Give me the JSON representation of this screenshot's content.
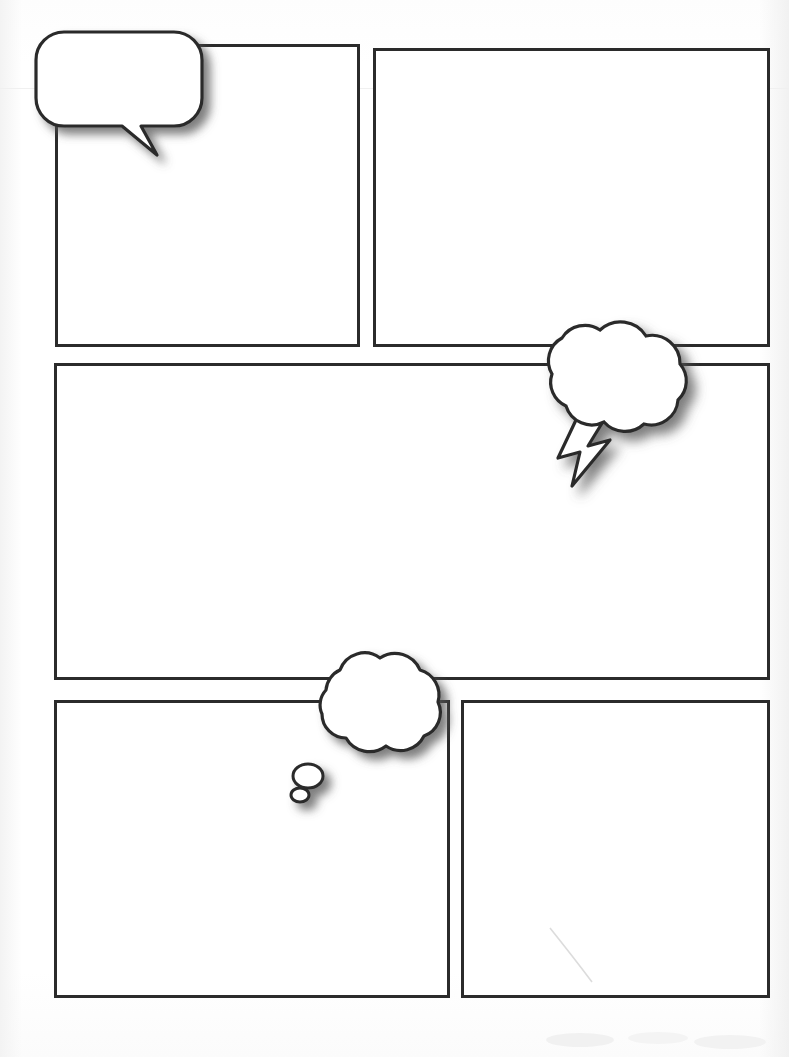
{
  "page": {
    "kind": "comic-page-template",
    "width": 789,
    "height": 1057,
    "background_color": "#ffffff",
    "ink_color": "#2b2b2b",
    "panel_border_width": 3,
    "panel_count": 5,
    "balloon_count": 3
  },
  "panels": [
    {
      "id": "panel-1",
      "label": "Panel 1",
      "row": 1,
      "column": 1,
      "x": 55,
      "y": 44,
      "width": 305,
      "height": 303
    },
    {
      "id": "panel-2",
      "label": "Panel 2",
      "row": 1,
      "column": 2,
      "x": 373,
      "y": 48,
      "width": 397,
      "height": 299
    },
    {
      "id": "panel-3",
      "label": "Panel 3",
      "row": 2,
      "column": 1,
      "x": 54,
      "y": 363,
      "width": 716,
      "height": 317
    },
    {
      "id": "panel-4",
      "label": "Panel 4",
      "row": 3,
      "column": 1,
      "x": 54,
      "y": 700,
      "width": 396,
      "height": 298
    },
    {
      "id": "panel-5",
      "label": "Panel 5",
      "row": 3,
      "column": 2,
      "x": 461,
      "y": 700,
      "width": 309,
      "height": 298
    }
  ],
  "balloons": [
    {
      "id": "balloon-speech",
      "type": "speech",
      "shape": "rounded-rectangle-with-pointed-tail",
      "label": "Speech balloon",
      "text": "",
      "x": 38,
      "y": 24,
      "width": 170,
      "height": 140,
      "tail_direction": "down-right",
      "fill": "#ffffff",
      "stroke": "#2b2b2b"
    },
    {
      "id": "balloon-burst",
      "type": "shout",
      "shape": "cloud-with-lightning-bolt-tail",
      "label": "Shout / burst cloud balloon",
      "text": "",
      "x": 505,
      "y": 305,
      "width": 200,
      "height": 190,
      "tail_direction": "down-left",
      "fill": "#ffffff",
      "stroke": "#2b2b2b"
    },
    {
      "id": "balloon-thought",
      "type": "thought",
      "shape": "cloud-with-trailing-dots",
      "label": "Thought balloon",
      "text": "",
      "x": 288,
      "y": 640,
      "width": 180,
      "height": 165,
      "tail_direction": "down-left",
      "dot_count": 2,
      "fill": "#ffffff",
      "stroke": "#2b2b2b"
    }
  ],
  "artifacts": {
    "scanline_y": 88,
    "scratch_label": "scan scratch",
    "smudge_label": "scan smudge"
  }
}
